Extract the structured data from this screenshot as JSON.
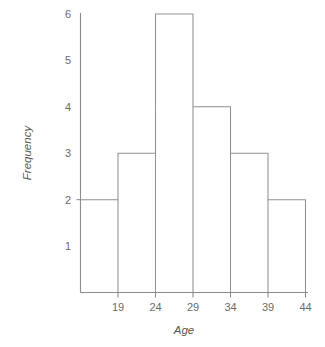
{
  "chart_data": {
    "type": "bar",
    "title": "",
    "subtitle": "",
    "xlabel": "Age",
    "ylabel": "Frequency",
    "categories": [
      "14-19",
      "19-24",
      "24-29",
      "29-34",
      "34-39",
      "39-44"
    ],
    "bin_edges": [
      14,
      19,
      24,
      29,
      34,
      39,
      44
    ],
    "values": [
      2,
      3,
      6,
      4,
      3,
      2
    ],
    "x_tick_labels": [
      "19",
      "24",
      "29",
      "34",
      "39",
      "44"
    ],
    "x_tick_values": [
      19,
      24,
      29,
      34,
      39,
      44
    ],
    "y_tick_labels": [
      "1",
      "2",
      "3",
      "4",
      "5",
      "6"
    ],
    "y_tick_values": [
      1,
      2,
      3,
      4,
      5,
      6
    ],
    "xlim": [
      14,
      44
    ],
    "ylim": [
      0,
      6
    ],
    "grid": false,
    "legend": null,
    "legend_position": "none",
    "bar_fill": "#ffffff",
    "bar_stroke": "#909090",
    "axis_color": "#8b8b8b",
    "text_color": "#6b6b6b",
    "background": "#ffffff",
    "annotations": []
  }
}
